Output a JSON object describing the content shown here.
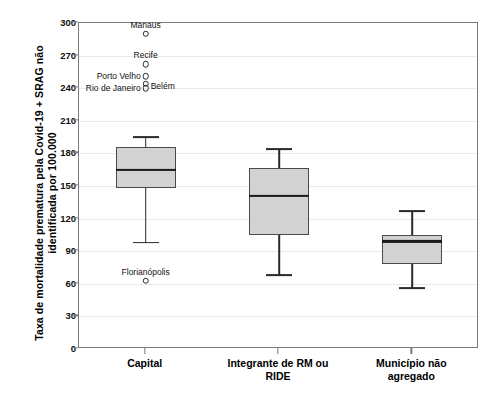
{
  "chart_data": {
    "type": "box",
    "title": "",
    "xlabel": "",
    "ylabel": "Taxa de mortalidade prematura pela Covid-19 + SRAG não\nidentificada por 100.000",
    "ylim": [
      0,
      300
    ],
    "ytick_step": 30,
    "yticks": [
      300,
      270,
      240,
      210,
      180,
      150,
      120,
      90,
      60,
      30,
      0
    ],
    "ytick_labels": [
      "300",
      "270",
      "240",
      "210",
      "180",
      "150",
      "120",
      "90",
      "60",
      "30",
      "0"
    ],
    "grid": true,
    "legend": "none",
    "categories": [
      "Capital",
      "Integrante de RM ou\nRIDE",
      "Município não\nagregado"
    ],
    "boxes": [
      {
        "category": "Capital",
        "whisker_low": 98,
        "q1": 148,
        "median": 165,
        "q3": 186,
        "whisker_high": 195,
        "outliers": [
          {
            "label": "Manaus",
            "value": 290,
            "label_pos": "center"
          },
          {
            "label": "Recife",
            "value": 262,
            "label_pos": "center"
          },
          {
            "label": "Porto Velho",
            "value": 251,
            "label_pos": "right"
          },
          {
            "label": "Belém",
            "value": 244,
            "label_pos": "left"
          },
          {
            "label": "Rio de Janeiro",
            "value": 240,
            "label_pos": "right"
          },
          {
            "label": "Florianópolis",
            "value": 63,
            "label_pos": "center"
          }
        ]
      },
      {
        "category": "Integrante de RM ou RIDE",
        "whisker_low": 68,
        "q1": 105,
        "median": 141,
        "q3": 167,
        "whisker_high": 184,
        "outliers": []
      },
      {
        "category": "Município não agregado",
        "whisker_low": 56,
        "q1": 78,
        "median": 99,
        "q3": 105,
        "whisker_high": 127,
        "outliers": []
      }
    ],
    "colors": {
      "box_fill": "#d2d2d2",
      "box_border": "#4a4a4a",
      "median": "#1a1a1a",
      "whisker": "#2a2a2a",
      "frame": "#7a7a7a",
      "gridline": "#e9e9ec",
      "background": "#ffffff",
      "text": "#111111"
    }
  }
}
